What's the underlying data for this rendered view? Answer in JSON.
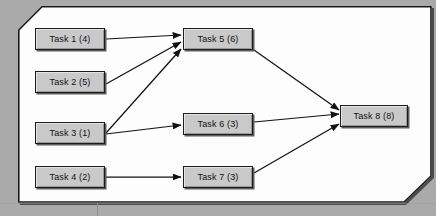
{
  "diagram": {
    "type": "task-dependency-network",
    "background_color": "#aaaaab",
    "panel_color": "#fdfdfd",
    "node_fill_color": "#c9c9c9",
    "node_border_color": "#1c1c1c",
    "edge_color": "#111111",
    "nodes": [
      {
        "id": "task1",
        "label": "Task 1 (4)",
        "name": "Task 1",
        "duration": 4,
        "x": 35,
        "y": 28,
        "w": 70,
        "h": 22
      },
      {
        "id": "task2",
        "label": "Task 2 (5)",
        "name": "Task 2",
        "duration": 5,
        "x": 35,
        "y": 71,
        "w": 70,
        "h": 22
      },
      {
        "id": "task3",
        "label": "Task 3 (1)",
        "name": "Task 3",
        "duration": 1,
        "x": 35,
        "y": 122,
        "w": 70,
        "h": 22
      },
      {
        "id": "task4",
        "label": "Task 4 (2)",
        "name": "Task 4",
        "duration": 2,
        "x": 35,
        "y": 166,
        "w": 70,
        "h": 22
      },
      {
        "id": "task5",
        "label": "Task 5 (6)",
        "name": "Task 5",
        "duration": 6,
        "x": 183,
        "y": 28,
        "w": 70,
        "h": 22
      },
      {
        "id": "task6",
        "label": "Task 6 (3)",
        "name": "Task 6",
        "duration": 3,
        "x": 183,
        "y": 113,
        "w": 70,
        "h": 22
      },
      {
        "id": "task7",
        "label": "Task 7 (3)",
        "name": "Task 7",
        "duration": 3,
        "x": 183,
        "y": 166,
        "w": 70,
        "h": 22
      },
      {
        "id": "task8",
        "label": "Task 8 (8)",
        "name": "Task 8",
        "duration": 8,
        "x": 340,
        "y": 105,
        "w": 68,
        "h": 22
      }
    ],
    "edges": [
      {
        "from": "task1",
        "to": "task5"
      },
      {
        "from": "task2",
        "to": "task5"
      },
      {
        "from": "task3",
        "to": "task5"
      },
      {
        "from": "task3",
        "to": "task6"
      },
      {
        "from": "task4",
        "to": "task7"
      },
      {
        "from": "task5",
        "to": "task8"
      },
      {
        "from": "task6",
        "to": "task8"
      },
      {
        "from": "task7",
        "to": "task8"
      }
    ]
  }
}
